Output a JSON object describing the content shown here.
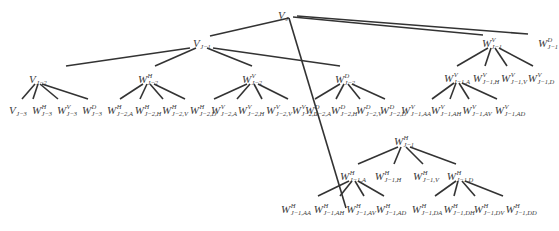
{
  "diagram": {
    "line_color": "#333333",
    "nodes": [
      {
        "id": "n0",
        "base": "V",
        "sup": "",
        "sub": "J",
        "x": 283,
        "y": 14
      },
      {
        "id": "n1",
        "base": "V",
        "sup": "",
        "sub": "J−1",
        "x": 202,
        "y": 42
      },
      {
        "id": "n2",
        "base": "W",
        "sup": "V",
        "sub": "J−1",
        "x": 492,
        "y": 42
      },
      {
        "id": "n3",
        "base": "W",
        "sup": "D",
        "sub": "J−1",
        "x": 548,
        "y": 42
      },
      {
        "id": "n4",
        "base": "V",
        "sup": "",
        "sub": "J−2",
        "x": 38,
        "y": 78
      },
      {
        "id": "n5",
        "base": "W",
        "sup": "H",
        "sub": "J−2",
        "x": 148,
        "y": 78
      },
      {
        "id": "n6",
        "base": "W",
        "sup": "V",
        "sub": "J−2",
        "x": 252,
        "y": 78
      },
      {
        "id": "n7",
        "base": "W",
        "sup": "D",
        "sub": "J−2",
        "x": 345,
        "y": 78
      },
      {
        "id": "n8",
        "base": "W",
        "sup": "V",
        "sub": "J−1,A",
        "x": 457,
        "y": 77
      },
      {
        "id": "n9",
        "base": "W",
        "sup": "V",
        "sub": "J−1,H",
        "x": 486,
        "y": 77
      },
      {
        "id": "n10",
        "base": "W",
        "sup": "V",
        "sub": "J−1,V",
        "x": 514,
        "y": 77
      },
      {
        "id": "n11",
        "base": "W",
        "sup": "V",
        "sub": "J−1,D",
        "x": 541,
        "y": 77
      },
      {
        "id": "n12",
        "base": "V",
        "sup": "",
        "sub": "J−3",
        "x": 18,
        "y": 109
      },
      {
        "id": "n13",
        "base": "W",
        "sup": "H",
        "sub": "J−3",
        "x": 42,
        "y": 109
      },
      {
        "id": "n14",
        "base": "W",
        "sup": "V",
        "sub": "J−3",
        "x": 67,
        "y": 109
      },
      {
        "id": "n15",
        "base": "W",
        "sup": "D",
        "sub": "J−3",
        "x": 92,
        "y": 109
      },
      {
        "id": "n16",
        "base": "W",
        "sup": "H",
        "sub": "J−2,A",
        "x": 120,
        "y": 109
      },
      {
        "id": "n17",
        "base": "W",
        "sup": "H",
        "sub": "J−2,H",
        "x": 148,
        "y": 109
      },
      {
        "id": "n18",
        "base": "W",
        "sup": "H",
        "sub": "J−2,V",
        "x": 175,
        "y": 109
      },
      {
        "id": "n19",
        "base": "W",
        "sup": "H",
        "sub": "J−2,D",
        "x": 203,
        "y": 109
      },
      {
        "id": "n20",
        "base": "W",
        "sup": "V",
        "sub": "J−2,A",
        "x": 224,
        "y": 109
      },
      {
        "id": "n21",
        "base": "W",
        "sup": "V",
        "sub": "J−2,H",
        "x": 251,
        "y": 109
      },
      {
        "id": "n22",
        "base": "W",
        "sup": "V",
        "sub": "J−2,V",
        "x": 279,
        "y": 109
      },
      {
        "id": "n23",
        "base": "W",
        "sup": "V",
        "sub": "J−2,D",
        "x": 305,
        "y": 109
      },
      {
        "id": "n24",
        "base": "W",
        "sup": "D",
        "sub": "J−2,A",
        "x": 318,
        "y": 109
      },
      {
        "id": "n25",
        "base": "W",
        "sup": "D",
        "sub": "J−2,H",
        "x": 344,
        "y": 109
      },
      {
        "id": "n26",
        "base": "W",
        "sup": "D",
        "sub": "J−2,V",
        "x": 369,
        "y": 109
      },
      {
        "id": "n27",
        "base": "W",
        "sup": "D",
        "sub": "J−2,D",
        "x": 393,
        "y": 109
      },
      {
        "id": "n28",
        "base": "W",
        "sup": "V",
        "sub": "J−1,AA",
        "x": 416,
        "y": 109
      },
      {
        "id": "n29",
        "base": "W",
        "sup": "V",
        "sub": "J−1,AH",
        "x": 446,
        "y": 109
      },
      {
        "id": "n30",
        "base": "W",
        "sup": "V",
        "sub": "J−1,AV",
        "x": 477,
        "y": 109
      },
      {
        "id": "n31",
        "base": "W",
        "sup": "V",
        "sub": "J−1,AD",
        "x": 510,
        "y": 109
      },
      {
        "id": "n32",
        "base": "W",
        "sup": "H",
        "sub": "J−1",
        "x": 404,
        "y": 140
      },
      {
        "id": "n33",
        "base": "W",
        "sup": "H",
        "sub": "J−1,A",
        "x": 353,
        "y": 175
      },
      {
        "id": "n34",
        "base": "W",
        "sup": "H",
        "sub": "J−1,H",
        "x": 388,
        "y": 175
      },
      {
        "id": "n35",
        "base": "W",
        "sup": "H",
        "sub": "J−1,V",
        "x": 426,
        "y": 175
      },
      {
        "id": "n36",
        "base": "W",
        "sup": "H",
        "sub": "J−1,D",
        "x": 460,
        "y": 175
      },
      {
        "id": "n37",
        "base": "W",
        "sup": "H",
        "sub": "J−1,AA",
        "x": 296,
        "y": 208
      },
      {
        "id": "n38",
        "base": "W",
        "sup": "H",
        "sub": "J−1,AH",
        "x": 329,
        "y": 208
      },
      {
        "id": "n39",
        "base": "W",
        "sup": "H",
        "sub": "J−1,AV",
        "x": 361,
        "y": 208
      },
      {
        "id": "n40",
        "base": "W",
        "sup": "H",
        "sub": "J−1,AD",
        "x": 391,
        "y": 208
      },
      {
        "id": "n41",
        "base": "W",
        "sup": "H",
        "sub": "J−1,DA",
        "x": 427,
        "y": 208
      },
      {
        "id": "n42",
        "base": "W",
        "sup": "H",
        "sub": "J−1,DH",
        "x": 459,
        "y": 208
      },
      {
        "id": "n43",
        "base": "W",
        "sup": "H",
        "sub": "J−1,DV",
        "x": 489,
        "y": 208
      },
      {
        "id": "n44",
        "base": "W",
        "sup": "H",
        "sub": "J−1,DD",
        "x": 521,
        "y": 208
      }
    ],
    "edges": [
      [
        289,
        18,
        210,
        36
      ],
      [
        289,
        18,
        346,
        208
      ],
      [
        293,
        17,
        483,
        35
      ],
      [
        297,
        16,
        528,
        34
      ],
      [
        190,
        48,
        66,
        66
      ],
      [
        196,
        48,
        155,
        66
      ],
      [
        207,
        48,
        252,
        66
      ],
      [
        213,
        48,
        340,
        66
      ],
      [
        35,
        84,
        22,
        99
      ],
      [
        38,
        84,
        33,
        99
      ],
      [
        40,
        84,
        58,
        99
      ],
      [
        42,
        84,
        88,
        99
      ],
      [
        143,
        84,
        120,
        99
      ],
      [
        147,
        84,
        140,
        99
      ],
      [
        150,
        84,
        163,
        99
      ],
      [
        154,
        84,
        185,
        99
      ],
      [
        247,
        84,
        214,
        99
      ],
      [
        250,
        84,
        237,
        99
      ],
      [
        254,
        84,
        262,
        99
      ],
      [
        258,
        84,
        288,
        99
      ],
      [
        340,
        84,
        315,
        99
      ],
      [
        344,
        84,
        336,
        99
      ],
      [
        348,
        84,
        360,
        99
      ],
      [
        352,
        84,
        385,
        99
      ],
      [
        488,
        48,
        457,
        66
      ],
      [
        491,
        48,
        485,
        66
      ],
      [
        495,
        48,
        507,
        66
      ],
      [
        499,
        48,
        533,
        66
      ],
      [
        454,
        83,
        432,
        99
      ],
      [
        456,
        83,
        450,
        99
      ],
      [
        459,
        83,
        469,
        99
      ],
      [
        462,
        83,
        497,
        99
      ],
      [
        398,
        147,
        358,
        164
      ],
      [
        401,
        147,
        394,
        164
      ],
      [
        406,
        147,
        423,
        164
      ],
      [
        410,
        147,
        456,
        164
      ],
      [
        349,
        181,
        318,
        196
      ],
      [
        352,
        181,
        340,
        196
      ],
      [
        355,
        181,
        364,
        196
      ],
      [
        358,
        181,
        384,
        196
      ],
      [
        456,
        181,
        435,
        196
      ],
      [
        458,
        181,
        454,
        196
      ],
      [
        462,
        181,
        475,
        196
      ],
      [
        465,
        181,
        503,
        196
      ]
    ]
  }
}
